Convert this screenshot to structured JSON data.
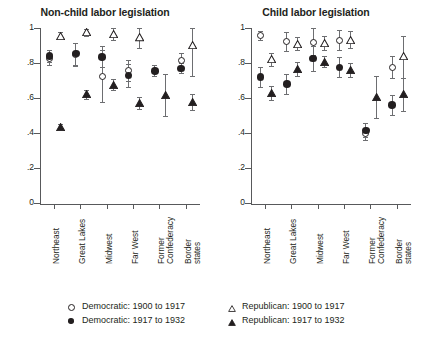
{
  "chart_data": {
    "type": "scatter",
    "layout": "two-panel",
    "ylim": [
      0,
      1
    ],
    "ytick_labels": [
      "0",
      ".2",
      ".4",
      ".6",
      ".8",
      "1"
    ],
    "ytick_values": [
      0,
      0.2,
      0.4,
      0.6,
      0.8,
      1
    ],
    "grid": false,
    "xlabel": "",
    "ylabel": "",
    "categories": [
      "Northeast",
      "Great Lakes",
      "Midwest",
      "Far West",
      "Former Confederacy",
      "Border states"
    ],
    "legend_position": "bottom",
    "series": [
      {
        "name": "Democratic: 1900 to 1917",
        "marker": "open-circle"
      },
      {
        "name": "Democratic: 1917 to 1932",
        "marker": "filled-circle"
      },
      {
        "name": "Republican: 1900 to 1917",
        "marker": "open-triangle"
      },
      {
        "name": "Republican: 1917 to 1932",
        "marker": "filled-triangle"
      }
    ],
    "panels": [
      {
        "title": "Non-child labor legislation",
        "points": [
          {
            "category": "Northeast",
            "series": "Democratic: 1900 to 1917",
            "value": 0.825,
            "lo": 0.79,
            "hi": 0.86
          },
          {
            "category": "Northeast",
            "series": "Democratic: 1917 to 1932",
            "value": 0.84,
            "lo": 0.805,
            "hi": 0.875
          },
          {
            "category": "Northeast",
            "series": "Republican: 1900 to 1917",
            "value": 0.955,
            "lo": 0.935,
            "hi": 0.975
          },
          {
            "category": "Northeast",
            "series": "Republican: 1917 to 1932",
            "value": 0.435,
            "lo": 0.425,
            "hi": 0.45
          },
          {
            "category": "Great Lakes",
            "series": "Democratic: 1900 to 1917",
            "value": 0.85,
            "lo": 0.785,
            "hi": 0.915
          },
          {
            "category": "Great Lakes",
            "series": "Democratic: 1917 to 1932",
            "value": 0.855,
            "lo": 0.79,
            "hi": 0.915
          },
          {
            "category": "Great Lakes",
            "series": "Republican: 1900 to 1917",
            "value": 0.975,
            "lo": 0.955,
            "hi": 0.995
          },
          {
            "category": "Great Lakes",
            "series": "Republican: 1917 to 1932",
            "value": 0.62,
            "lo": 0.595,
            "hi": 0.645
          },
          {
            "category": "Midwest",
            "series": "Democratic: 1900 to 1917",
            "value": 0.725,
            "lo": 0.575,
            "hi": 0.875
          },
          {
            "category": "Midwest",
            "series": "Democratic: 1917 to 1932",
            "value": 0.835,
            "lo": 0.775,
            "hi": 0.895
          },
          {
            "category": "Midwest",
            "series": "Republican: 1900 to 1917",
            "value": 0.965,
            "lo": 0.93,
            "hi": 1.0
          },
          {
            "category": "Midwest",
            "series": "Republican: 1917 to 1932",
            "value": 0.675,
            "lo": 0.645,
            "hi": 0.71
          },
          {
            "category": "Far West",
            "series": "Democratic: 1900 to 1917",
            "value": 0.755,
            "lo": 0.695,
            "hi": 0.815
          },
          {
            "category": "Far West",
            "series": "Democratic: 1917 to 1932",
            "value": 0.73,
            "lo": 0.665,
            "hi": 0.795
          },
          {
            "category": "Far West",
            "series": "Republican: 1900 to 1917",
            "value": 0.945,
            "lo": 0.885,
            "hi": 1.0
          },
          {
            "category": "Far West",
            "series": "Republican: 1917 to 1932",
            "value": 0.57,
            "lo": 0.54,
            "hi": 0.605
          },
          {
            "category": "Former Confederacy",
            "series": "Democratic: 1917 to 1932",
            "value": 0.755,
            "lo": 0.725,
            "hi": 0.79
          },
          {
            "category": "Former Confederacy",
            "series": "Republican: 1917 to 1932",
            "value": 0.615,
            "lo": 0.495,
            "hi": 0.735
          },
          {
            "category": "Border states",
            "series": "Democratic: 1900 to 1917",
            "value": 0.815,
            "lo": 0.775,
            "hi": 0.855
          },
          {
            "category": "Border states",
            "series": "Democratic: 1917 to 1932",
            "value": 0.77,
            "lo": 0.745,
            "hi": 0.8
          },
          {
            "category": "Border states",
            "series": "Republican: 1900 to 1917",
            "value": 0.9,
            "lo": 0.725,
            "hi": 1.0
          },
          {
            "category": "Border states",
            "series": "Republican: 1917 to 1932",
            "value": 0.575,
            "lo": 0.53,
            "hi": 0.625
          }
        ]
      },
      {
        "title": "Child labor legislation",
        "points": [
          {
            "category": "Northeast",
            "series": "Democratic: 1900 to 1917",
            "value": 0.955,
            "lo": 0.93,
            "hi": 0.985
          },
          {
            "category": "Northeast",
            "series": "Democratic: 1917 to 1932",
            "value": 0.72,
            "lo": 0.665,
            "hi": 0.775
          },
          {
            "category": "Northeast",
            "series": "Republican: 1900 to 1917",
            "value": 0.82,
            "lo": 0.785,
            "hi": 0.86
          },
          {
            "category": "Northeast",
            "series": "Republican: 1917 to 1932",
            "value": 0.63,
            "lo": 0.59,
            "hi": 0.67
          },
          {
            "category": "Great Lakes",
            "series": "Democratic: 1900 to 1917",
            "value": 0.925,
            "lo": 0.87,
            "hi": 0.975
          },
          {
            "category": "Great Lakes",
            "series": "Democratic: 1917 to 1932",
            "value": 0.68,
            "lo": 0.625,
            "hi": 0.735
          },
          {
            "category": "Great Lakes",
            "series": "Republican: 1900 to 1917",
            "value": 0.91,
            "lo": 0.875,
            "hi": 0.95
          },
          {
            "category": "Great Lakes",
            "series": "Republican: 1917 to 1932",
            "value": 0.765,
            "lo": 0.725,
            "hi": 0.805
          },
          {
            "category": "Midwest",
            "series": "Democratic: 1900 to 1917",
            "value": 0.92,
            "lo": 0.845,
            "hi": 1.0
          },
          {
            "category": "Midwest",
            "series": "Democratic: 1917 to 1932",
            "value": 0.825,
            "lo": 0.755,
            "hi": 0.895
          },
          {
            "category": "Midwest",
            "series": "Republican: 1900 to 1917",
            "value": 0.915,
            "lo": 0.875,
            "hi": 0.955
          },
          {
            "category": "Midwest",
            "series": "Republican: 1917 to 1932",
            "value": 0.805,
            "lo": 0.775,
            "hi": 0.84
          },
          {
            "category": "Far West",
            "series": "Democratic: 1900 to 1917",
            "value": 0.93,
            "lo": 0.875,
            "hi": 0.99
          },
          {
            "category": "Far West",
            "series": "Democratic: 1917 to 1932",
            "value": 0.775,
            "lo": 0.72,
            "hi": 0.835
          },
          {
            "category": "Far West",
            "series": "Republican: 1900 to 1917",
            "value": 0.93,
            "lo": 0.885,
            "hi": 0.985
          },
          {
            "category": "Far West",
            "series": "Republican: 1917 to 1932",
            "value": 0.76,
            "lo": 0.72,
            "hi": 0.8
          },
          {
            "category": "Former Confederacy",
            "series": "Democratic: 1900 to 1917",
            "value": 0.395,
            "lo": 0.36,
            "hi": 0.43
          },
          {
            "category": "Former Confederacy",
            "series": "Democratic: 1917 to 1932",
            "value": 0.415,
            "lo": 0.375,
            "hi": 0.455
          },
          {
            "category": "Former Confederacy",
            "series": "Republican: 1917 to 1932",
            "value": 0.605,
            "lo": 0.485,
            "hi": 0.725
          },
          {
            "category": "Border states",
            "series": "Democratic: 1900 to 1917",
            "value": 0.775,
            "lo": 0.715,
            "hi": 0.84
          },
          {
            "category": "Border states",
            "series": "Democratic: 1917 to 1932",
            "value": 0.56,
            "lo": 0.505,
            "hi": 0.615
          },
          {
            "category": "Border states",
            "series": "Republican: 1900 to 1917",
            "value": 0.84,
            "lo": 0.715,
            "hi": 0.955
          },
          {
            "category": "Border states",
            "series": "Republican: 1917 to 1932",
            "value": 0.62,
            "lo": 0.525,
            "hi": 0.715
          }
        ]
      }
    ]
  },
  "panels": {
    "left": {
      "title": "Non-child labor legislation"
    },
    "right": {
      "title": "Child labor legislation"
    }
  },
  "axis": {
    "ytick_labels": [
      "1",
      ".8",
      ".6",
      ".4",
      ".2",
      "0"
    ],
    "xlabels": [
      "Northeast",
      "Great Lakes",
      "Midwest",
      "Far West",
      "Former Confederacy",
      "Border states"
    ],
    "xlabels_split": [
      [
        "Northeast"
      ],
      [
        "Great Lakes"
      ],
      [
        "Midwest"
      ],
      [
        "Far West"
      ],
      [
        "Former",
        "Confederacy"
      ],
      [
        "Border",
        "states"
      ]
    ]
  },
  "legend": {
    "items": [
      {
        "label": "Democratic: 1900 to 1917",
        "marker": "open-circle"
      },
      {
        "label": "Democratic: 1917 to 1932",
        "marker": "filled-circle"
      },
      {
        "label": "Republican: 1900 to 1917",
        "marker": "open-triangle"
      },
      {
        "label": "Republican: 1917 to 1932",
        "marker": "filled-triangle"
      }
    ]
  },
  "colors": {
    "ink": "#231f20",
    "axis": "#58595b",
    "errorbar": "#6d6e71",
    "background": "#ffffff"
  }
}
